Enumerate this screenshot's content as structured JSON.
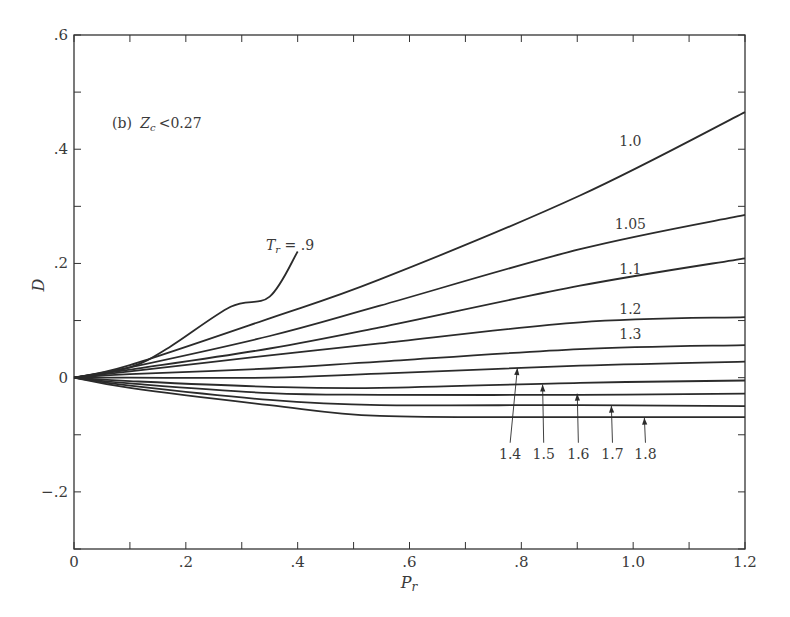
{
  "chart_data": {
    "type": "line",
    "title": "",
    "annotation": "(b) Z_c < 0.27",
    "annotation_parts": {
      "prefix": "(b)",
      "var": "Z",
      "sub": "c",
      "rel": "<0.27"
    },
    "xlabel": "P_r",
    "ylabel": "D",
    "xlim": [
      0,
      1.2
    ],
    "ylim": [
      -0.3,
      0.6
    ],
    "grid": false,
    "legend": "inline curve labels",
    "x_ticks": [
      0,
      0.1,
      0.2,
      0.3,
      0.4,
      0.5,
      0.6,
      0.7,
      0.8,
      0.9,
      1.0,
      1.1,
      1.2
    ],
    "x_tick_labels": [
      {
        "value": 0,
        "label": "0"
      },
      {
        "value": 0.2,
        "label": ".2"
      },
      {
        "value": 0.4,
        "label": ".4"
      },
      {
        "value": 0.6,
        "label": ".6"
      },
      {
        "value": 0.8,
        "label": ".8"
      },
      {
        "value": 1.0,
        "label": "1.0"
      },
      {
        "value": 1.2,
        "label": "1.2"
      }
    ],
    "y_ticks": [
      -0.3,
      -0.2,
      -0.1,
      0,
      0.1,
      0.2,
      0.3,
      0.4,
      0.5,
      0.6
    ],
    "y_tick_labels": [
      {
        "value": 0.6,
        "label": ".6"
      },
      {
        "value": 0.4,
        "label": ".4"
      },
      {
        "value": 0.2,
        "label": ".2"
      },
      {
        "value": 0,
        "label": "0"
      },
      {
        "value": -0.2,
        "label": "−.2"
      }
    ],
    "series": [
      {
        "name": "Tr = 0.9",
        "label": "T_r = .9",
        "x": [
          0,
          0.1,
          0.17,
          0.28,
          0.35,
          0.4
        ],
        "y": [
          0,
          0.018,
          0.053,
          0.124,
          0.142,
          0.221
        ]
      },
      {
        "name": "Tr = 1.0",
        "label": "1.0",
        "x": [
          0,
          0.1,
          0.35,
          0.547,
          0.905,
          1.2
        ],
        "y": [
          0,
          0.022,
          0.104,
          0.172,
          0.319,
          0.465
        ]
      },
      {
        "name": "Tr = 1.05",
        "label": "1.05",
        "x": [
          0,
          0.1,
          0.35,
          0.547,
          0.905,
          1.2
        ],
        "y": [
          0,
          0.018,
          0.073,
          0.126,
          0.225,
          0.285
        ]
      },
      {
        "name": "Tr = 1.1",
        "label": "1.1",
        "x": [
          0,
          0.1,
          0.35,
          0.547,
          0.905,
          1.2
        ],
        "y": [
          0,
          0.014,
          0.051,
          0.088,
          0.161,
          0.209
        ]
      },
      {
        "name": "Tr = 1.2",
        "label": "1.2",
        "x": [
          0,
          0.1,
          0.35,
          0.547,
          0.905,
          1.2
        ],
        "y": [
          0,
          0.011,
          0.039,
          0.06,
          0.097,
          0.106
        ]
      },
      {
        "name": "Tr = 1.3",
        "label": "1.3",
        "x": [
          0,
          0.1,
          0.35,
          0.547,
          0.905,
          1.2
        ],
        "y": [
          0,
          0.006,
          0.016,
          0.028,
          0.05,
          0.057
        ]
      },
      {
        "name": "Tr = 1.4",
        "label": "1.4",
        "x": [
          0,
          0.1,
          0.35,
          0.547,
          0.905,
          1.2
        ],
        "y": [
          0,
          0.0,
          0.0,
          0.007,
          0.021,
          0.028
        ]
      },
      {
        "name": "Tr = 1.5",
        "label": "1.5",
        "x": [
          0,
          0.1,
          0.35,
          0.547,
          0.905,
          1.2
        ],
        "y": [
          0,
          -0.006,
          -0.016,
          -0.018,
          -0.009,
          -0.005
        ]
      },
      {
        "name": "Tr = 1.6",
        "label": "1.6",
        "x": [
          0,
          0.1,
          0.35,
          0.547,
          0.905,
          1.2
        ],
        "y": [
          0,
          -0.01,
          -0.027,
          -0.03,
          -0.03,
          -0.028
        ]
      },
      {
        "name": "Tr = 1.7",
        "label": "1.7",
        "x": [
          0,
          0.1,
          0.35,
          0.547,
          0.905,
          1.2
        ],
        "y": [
          0,
          -0.014,
          -0.039,
          -0.048,
          -0.048,
          -0.05
        ]
      },
      {
        "name": "Tr = 1.8",
        "label": "1.8",
        "x": [
          0,
          0.1,
          0.35,
          0.547,
          0.905,
          1.2
        ],
        "y": [
          0,
          -0.018,
          -0.048,
          -0.067,
          -0.069,
          -0.069
        ]
      }
    ],
    "inline_labels": [
      {
        "text": "1.0",
        "x": 0.995,
        "y": 0.405
      },
      {
        "text": "1.05",
        "x": 0.995,
        "y": 0.26
      },
      {
        "text": "1.1",
        "x": 0.995,
        "y": 0.182
      },
      {
        "text": "1.2",
        "x": 0.995,
        "y": 0.112
      },
      {
        "text": "1.3",
        "x": 0.995,
        "y": 0.068
      }
    ],
    "arrow_labels": [
      {
        "text": "1.4",
        "label_x": 0.78,
        "label_y": -0.142,
        "tip_x": 0.793,
        "tip_y": 0.017
      },
      {
        "text": "1.5",
        "label_x": 0.84,
        "label_y": -0.142,
        "tip_x": 0.838,
        "tip_y": -0.012
      },
      {
        "text": "1.6",
        "label_x": 0.902,
        "label_y": -0.142,
        "tip_x": 0.9,
        "tip_y": -0.028
      },
      {
        "text": "1.7",
        "label_x": 0.963,
        "label_y": -0.142,
        "tip_x": 0.961,
        "tip_y": -0.049
      },
      {
        "text": "1.8",
        "label_x": 1.022,
        "label_y": -0.142,
        "tip_x": 1.02,
        "tip_y": -0.07
      }
    ],
    "colors": {
      "line": "#2b2b2b",
      "axis": "#333333",
      "text": "#3a3a3a",
      "background": "#ffffff"
    }
  }
}
